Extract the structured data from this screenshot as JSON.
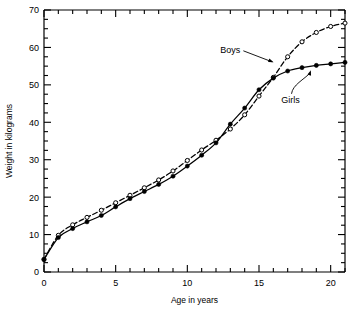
{
  "chart_data": {
    "type": "line",
    "title": "",
    "xlabel": "Age in years",
    "ylabel": "Weight in kilograms",
    "xlim": [
      0,
      21
    ],
    "ylim": [
      0,
      70
    ],
    "xticks": [
      0,
      5,
      10,
      15,
      20
    ],
    "xticklabels": [
      "0",
      "5",
      "10",
      "15",
      "20"
    ],
    "xminorticks": [
      1,
      2,
      3,
      4,
      6,
      7,
      8,
      9,
      11,
      12,
      13,
      14,
      16,
      17,
      18,
      19,
      21
    ],
    "yticks": [
      0,
      10,
      20,
      30,
      40,
      50,
      60,
      70
    ],
    "yticklabels": [
      "0",
      "10",
      "20",
      "30",
      "40",
      "50",
      "60",
      "70"
    ],
    "yminorticks": [
      2.5,
      5,
      7.5,
      12.5,
      15,
      17.5,
      22.5,
      25,
      27.5,
      32.5,
      35,
      37.5,
      42.5,
      45,
      47.5,
      52.5,
      55,
      57.5,
      62.5,
      65,
      67.5
    ],
    "grid": false,
    "legend_position": "inline-annotations",
    "x": [
      0,
      1,
      2,
      3,
      4,
      5,
      6,
      7,
      8,
      9,
      10,
      11,
      12,
      13,
      14,
      15,
      16,
      17,
      18,
      19,
      20,
      21
    ],
    "series": [
      {
        "name": "Boys",
        "marker": "open-circle",
        "linestyle": "dashed",
        "color": "#000000",
        "values": [
          3.4,
          9.8,
          12.6,
          14.6,
          16.5,
          18.5,
          20.5,
          22.5,
          24.6,
          27.0,
          29.8,
          32.6,
          35.2,
          38.2,
          42.0,
          47.0,
          52.0,
          57.5,
          61.5,
          64.0,
          65.6,
          66.5
        ]
      },
      {
        "name": "Girls",
        "marker": "filled-circle",
        "linestyle": "solid",
        "color": "#000000",
        "values": [
          3.3,
          9.2,
          11.6,
          13.4,
          15.1,
          17.4,
          19.6,
          21.5,
          23.4,
          25.6,
          28.3,
          31.2,
          34.5,
          39.5,
          43.8,
          48.7,
          51.8,
          53.7,
          54.6,
          55.2,
          55.6,
          56.0
        ]
      }
    ],
    "annotations": [
      {
        "text": "Boys",
        "x": 13.0,
        "y": 59.5,
        "points_to_x": 16.1,
        "points_to_y": 56.0
      },
      {
        "text": "Girls",
        "x": 17.2,
        "y": 46.0,
        "points_to_x": 18.6,
        "points_to_y": 54.5
      }
    ]
  }
}
